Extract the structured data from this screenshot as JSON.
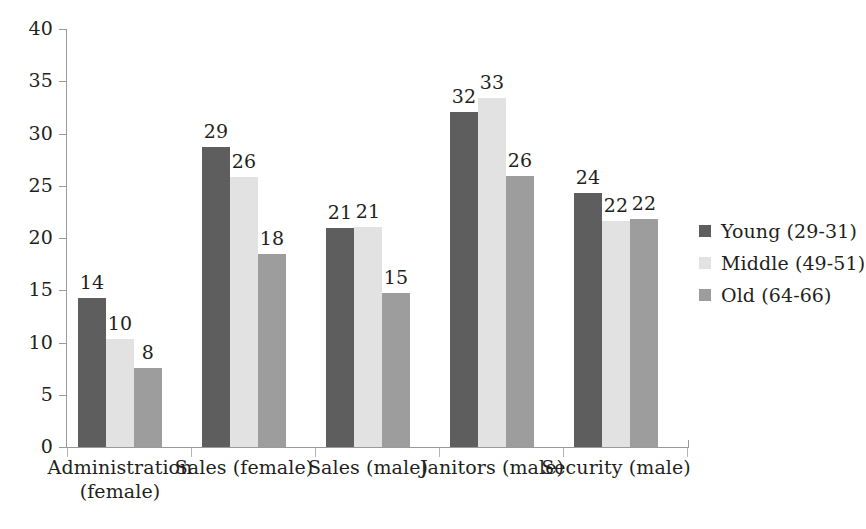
{
  "chart_data": {
    "type": "bar",
    "title": "",
    "subtitle": "",
    "xlabel": "",
    "ylabel": "",
    "ylim": [
      0,
      40
    ],
    "yticks": [
      0,
      5,
      10,
      15,
      20,
      25,
      30,
      35,
      40
    ],
    "grid": false,
    "legend_position": "right",
    "categories": [
      "Administration (female)",
      "Sales (female)",
      "Sales (male)",
      "Janitors (male)",
      "Security (male)"
    ],
    "category_lines": [
      [
        "Administration",
        "(female)"
      ],
      [
        "Sales (female)"
      ],
      [
        "Sales (male)"
      ],
      [
        "Janitors (male)"
      ],
      [
        "Security (male)"
      ]
    ],
    "series": [
      {
        "name": "Young (29-31)",
        "color": "#5e5e5e",
        "values": [
          14,
          29,
          21,
          32,
          24
        ],
        "plotted": [
          14.3,
          28.7,
          21.0,
          32.1,
          24.3
        ]
      },
      {
        "name": "Middle (49-51)",
        "color": "#e2e2e2",
        "values": [
          10,
          26,
          21,
          33,
          22
        ],
        "plotted": [
          10.3,
          25.8,
          21.1,
          33.4,
          21.6
        ]
      },
      {
        "name": "Old (64-66)",
        "color": "#9d9d9d",
        "values": [
          8,
          18,
          15,
          26,
          22
        ],
        "plotted": [
          7.6,
          18.5,
          14.7,
          25.9,
          21.8
        ]
      }
    ]
  },
  "legend": {
    "items": [
      {
        "label": "Young (29-31)",
        "swatch": "legend-swatch-young"
      },
      {
        "label": "Middle (49-51)",
        "swatch": "legend-swatch-middle"
      },
      {
        "label": "Old (64-66)",
        "swatch": "legend-swatch-old"
      }
    ]
  },
  "axis": {
    "y_tick_labels": [
      "40",
      "35",
      "30",
      "25",
      "20",
      "15",
      "10",
      "5",
      "0"
    ]
  },
  "page_bleed_text": ""
}
